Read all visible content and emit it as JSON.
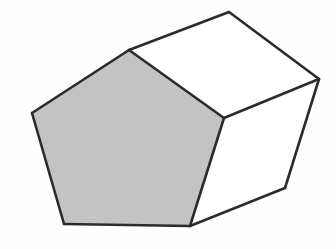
{
  "figure": {
    "background_color": "#fefefe",
    "stroke_color": "#2b2b2b",
    "stroke_width": 2.6,
    "shaded_fill": "#c3c3c3",
    "plain_fill": "#ffffff",
    "canvas": {
      "width": 336,
      "height": 249
    },
    "labels": {
      "front_face": "Shaded pentagonal face",
      "top_face": "Top receding face",
      "side_face": "Right receding face"
    },
    "vertices": {
      "front_left": [
        32,
        113
      ],
      "front_top": [
        129,
        50
      ],
      "front_right": [
        224,
        118
      ],
      "front_bottom_right": [
        190,
        226
      ],
      "front_bottom_left": [
        64,
        224
      ],
      "back_top": [
        229,
        12
      ],
      "back_right": [
        319,
        79
      ],
      "back_bottom_right": [
        285,
        188
      ]
    },
    "faces": [
      {
        "name": "front-pentagon-face",
        "shaded": true,
        "fill": "#c3c3c3",
        "points": "32,113 129,50 224,118 190,226 64,224"
      },
      {
        "name": "top-quadrilateral-face",
        "shaded": false,
        "fill": "#ffffff",
        "points": "129,50 229,12 319,79 224,118"
      },
      {
        "name": "right-quadrilateral-face",
        "shaded": false,
        "fill": "#ffffff",
        "points": "224,118 319,79 285,188 190,226"
      }
    ],
    "edges": [
      {
        "name": "front-edge-left-upper",
        "from": [
          32,
          113
        ],
        "to": [
          129,
          50
        ]
      },
      {
        "name": "front-edge-right-upper",
        "from": [
          129,
          50
        ],
        "to": [
          224,
          118
        ]
      },
      {
        "name": "front-edge-right-lower",
        "from": [
          224,
          118
        ],
        "to": [
          190,
          226
        ]
      },
      {
        "name": "front-edge-bottom",
        "from": [
          190,
          226
        ],
        "to": [
          64,
          224
        ]
      },
      {
        "name": "front-edge-left-lower",
        "from": [
          64,
          224
        ],
        "to": [
          32,
          113
        ]
      },
      {
        "name": "depth-edge-top",
        "from": [
          129,
          50
        ],
        "to": [
          229,
          12
        ]
      },
      {
        "name": "depth-edge-middle",
        "from": [
          224,
          118
        ],
        "to": [
          319,
          79
        ]
      },
      {
        "name": "depth-edge-bottom",
        "from": [
          190,
          226
        ],
        "to": [
          285,
          188
        ]
      },
      {
        "name": "back-edge-upper",
        "from": [
          229,
          12
        ],
        "to": [
          319,
          79
        ]
      },
      {
        "name": "back-edge-right",
        "from": [
          319,
          79
        ],
        "to": [
          285,
          188
        ]
      }
    ]
  }
}
